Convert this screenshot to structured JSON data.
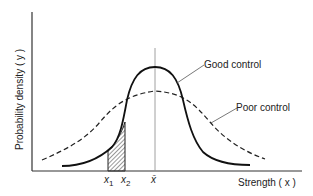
{
  "diagram": {
    "type": "normal-distribution-comparison",
    "y_axis_label": "Probability density ( y )",
    "x_axis_label": "Strength ( x )",
    "tick_labels": {
      "x1": "x",
      "x1_sub": "1",
      "x2": "x",
      "x2_sub": "2",
      "mean": "x̄"
    },
    "curves": [
      {
        "name": "Good control",
        "style": "solid",
        "relative_peak": "high",
        "spread": "narrow"
      },
      {
        "name": "Poor control",
        "style": "dashed",
        "relative_peak": "low",
        "spread": "wide"
      }
    ],
    "shaded_region": {
      "from": "x1",
      "to": "x2",
      "under": "Good control",
      "pattern": "hatched"
    },
    "colors": {
      "line": "#1a1a1a",
      "axis": "#333333",
      "mean_line": "#777777",
      "background": "#ffffff"
    }
  }
}
